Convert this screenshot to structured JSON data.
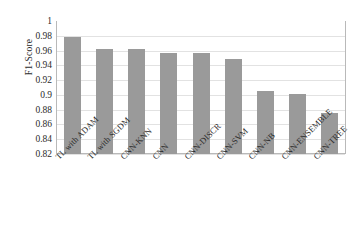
{
  "chart_data": {
    "type": "bar",
    "title": "",
    "xlabel": "",
    "ylabel": "F1-Score",
    "ylim": [
      0.82,
      1
    ],
    "ytick_step": 0.02,
    "grid": true,
    "legend": "none",
    "bar_color": "#9a9a9a",
    "categories": [
      "TL with ADAM",
      "TL with SGDM",
      "CNN-KNN",
      "CNN",
      "CNN-DISCR",
      "CNN-SVM",
      "CNN-NB",
      "CNN-ENSEMBLE",
      "CNN-TREE"
    ],
    "values": [
      0.979,
      0.962,
      0.962,
      0.957,
      0.957,
      0.948,
      0.905,
      0.901,
      0.875
    ],
    "ytick_labels": [
      "1",
      "0.98",
      "0.96",
      "0.94",
      "0.92",
      "0.9",
      "0.88",
      "0.86",
      "0.84",
      "0.82"
    ],
    "ytick_values": [
      1,
      0.98,
      0.96,
      0.94,
      0.92,
      0.9,
      0.88,
      0.86,
      0.84,
      0.82
    ]
  },
  "caption": ""
}
